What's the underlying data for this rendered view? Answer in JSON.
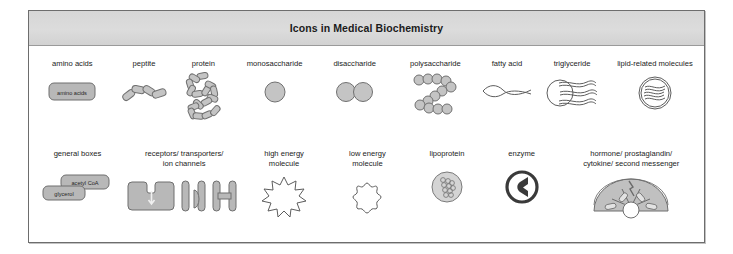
{
  "figure": {
    "title": "Icons in Medical Biochemistry",
    "accent_gray": "#b8b8b8",
    "border_color": "#6d6d6d",
    "title_bar_color": "#d6d6d6"
  },
  "rows": [
    {
      "name": "row-1",
      "items": [
        {
          "label": "amino acids",
          "icon": "amino-acids-box-icon",
          "box_labels": [
            "amino acids"
          ]
        },
        {
          "label": "peptite",
          "icon": "peptide-chain-icon"
        },
        {
          "label": "protein",
          "icon": "protein-folded-chain-icon"
        },
        {
          "label": "monosaccharide",
          "icon": "monosaccharide-circle-icon"
        },
        {
          "label": "disaccharide",
          "icon": "disaccharide-two-circles-icon"
        },
        {
          "label": "polysaccharide",
          "icon": "polysaccharide-chain-icon"
        },
        {
          "label": "fatty acid",
          "icon": "fatty-acid-wave-icon"
        },
        {
          "label": "triglyceride",
          "icon": "triglyceride-icon"
        },
        {
          "label": "lipid-related molecules",
          "icon": "lipid-related-molecules-icon"
        }
      ]
    },
    {
      "name": "row-2",
      "items": [
        {
          "label": "general boxes",
          "icon": "general-boxes-icon",
          "box_labels": [
            "acetyl CoA",
            "glycerol"
          ]
        },
        {
          "label": "receptors/ transporters/\nion channels",
          "icon": "receptors-transporters-ion-channels-icon"
        },
        {
          "label": "high energy\nmolecule",
          "icon": "high-energy-molecule-icon"
        },
        {
          "label": "low energy\nmolecule",
          "icon": "low-energy-molecule-icon"
        },
        {
          "label": "lipoprotein",
          "icon": "lipoprotein-icon"
        },
        {
          "label": "enzyme",
          "icon": "enzyme-icon"
        },
        {
          "label": "hormone/ prostaglandin/\ncytokine/ second messenger",
          "icon": "hormone-prostaglandin-cytokine-second-messenger-icon"
        }
      ]
    }
  ]
}
